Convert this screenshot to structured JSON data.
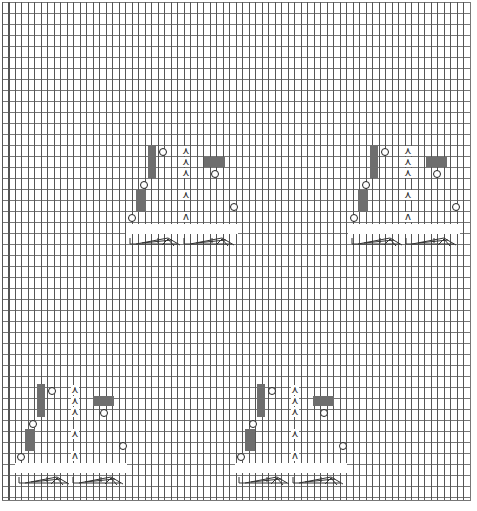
{
  "chart": {
    "type": "knitting-chart",
    "columns": 72,
    "rows": 45,
    "colors": {
      "grid": "#555555",
      "filled": "#6e6e6e",
      "symbol": "#222222"
    }
  },
  "legend_symbols": {
    "knit": "vertical line",
    "purl_block": "dark filled cell",
    "yarn_over": "circle",
    "decrease": "ʌ",
    "cable": "cable cross"
  },
  "motifs": [
    {
      "id": 1,
      "x": 126,
      "y": 145
    },
    {
      "id": 2,
      "x": 348,
      "y": 145
    },
    {
      "id": 3,
      "x": 15,
      "y": 384
    },
    {
      "id": 4,
      "x": 235,
      "y": 384
    }
  ],
  "symbols": {
    "decrease": "⋏",
    "decrease_plain": "ʌ"
  }
}
